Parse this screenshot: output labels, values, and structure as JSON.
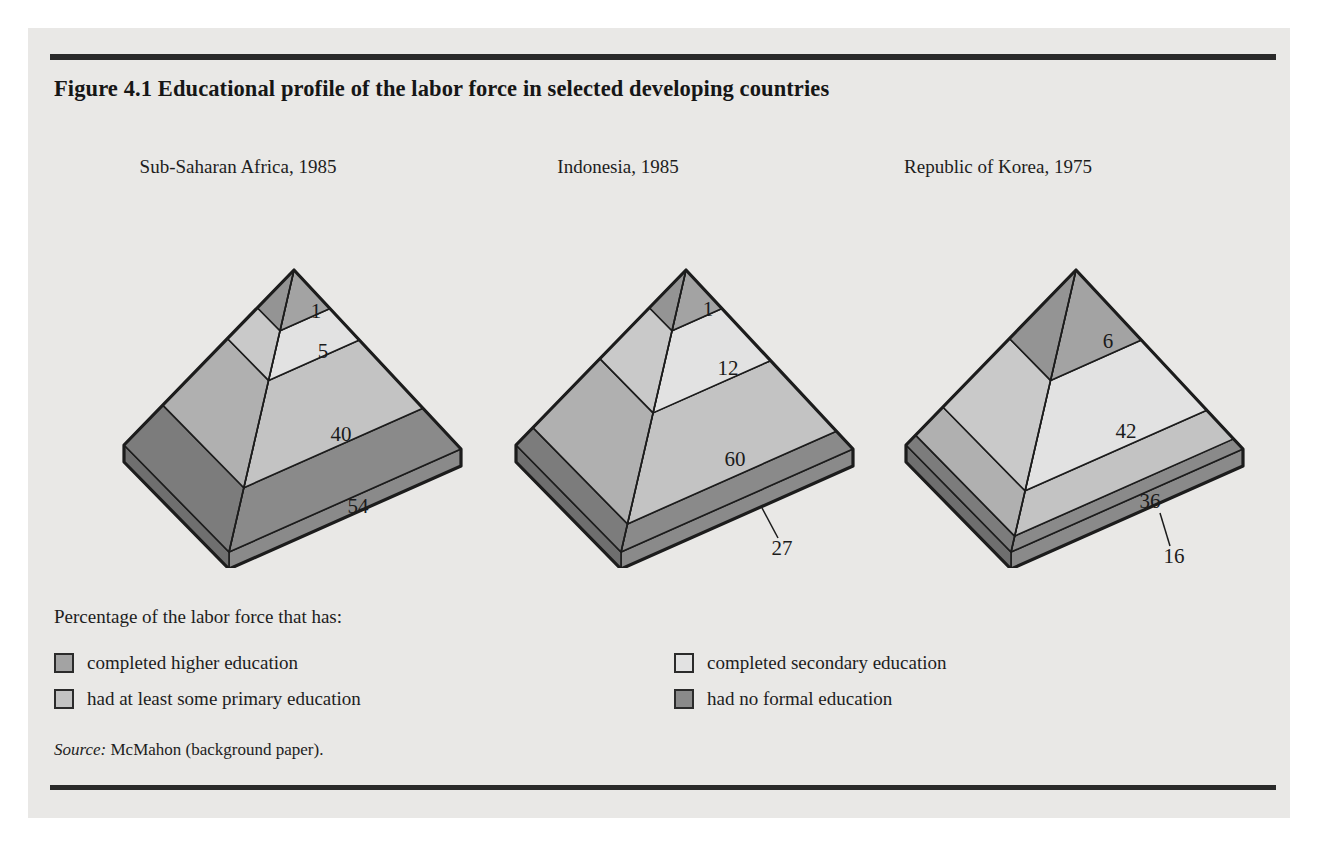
{
  "figure": {
    "title": "Figure 4.1  Educational profile of the labor force in selected developing countries",
    "source_label": "Source:",
    "source_text": "McMahon (background paper)."
  },
  "legend": {
    "intro": "Percentage of the labor force that has:",
    "items": [
      {
        "label": "completed higher education",
        "color": "#a3a3a3",
        "key": "higher"
      },
      {
        "label": "completed secondary education",
        "color": "#e2e2e2",
        "key": "secondary"
      },
      {
        "label": "had at least some primary education",
        "color": "#c3c3c3",
        "key": "primary"
      },
      {
        "label": "had no formal education",
        "color": "#8a8a8a",
        "key": "none"
      }
    ]
  },
  "colors": {
    "higher": "#a3a3a3",
    "secondary": "#e2e2e2",
    "primary": "#c3c3c3",
    "none": "#8a8a8a",
    "higher_shade": "#949494",
    "secondary_shade": "#c9c9c9",
    "primary_shade": "#b0b0b0",
    "none_shade": "#7c7c7c",
    "base_dark": "#8a8a8a",
    "base_dark_shade": "#6f6f6f",
    "outline": "#1c1c1c",
    "panel_bg": "#e9e8e6",
    "rule": "#2a2a2a",
    "text": "#1d1d1d"
  },
  "chart_data": {
    "type": "pie",
    "title": "Figure 4.1  Educational profile of the labor force in selected developing countries",
    "subtitle": "Percentage of the labor force that has:",
    "units": "percent of labor force",
    "legend_position": "bottom",
    "categories": [
      "completed higher education",
      "completed secondary education",
      "had at least some primary education",
      "had no formal education"
    ],
    "panels": [
      {
        "name": "Sub-Saharan Africa, 1985",
        "values": [
          1,
          5,
          40,
          54
        ],
        "labels": [
          "1",
          "5",
          "40",
          "54"
        ],
        "leader_line_on": []
      },
      {
        "name": "Indonesia, 1985",
        "values": [
          1,
          12,
          60,
          27
        ],
        "labels": [
          "1",
          "12",
          "60",
          "27"
        ],
        "leader_line_on": [
          "had no formal education"
        ]
      },
      {
        "name": "Republic of Korea, 1975",
        "values": [
          6,
          42,
          36,
          16
        ],
        "labels": [
          "6",
          "42",
          "36",
          "16"
        ],
        "leader_line_on": [
          "had no formal education"
        ]
      }
    ]
  },
  "pyramids": [
    {
      "title": "Sub-Saharan Africa, 1985",
      "segments": [
        {
          "key": "higher",
          "label": "1"
        },
        {
          "key": "secondary",
          "label": "5"
        },
        {
          "key": "primary",
          "label": "40"
        },
        {
          "key": "none",
          "label": "54"
        }
      ]
    },
    {
      "title": "Indonesia, 1985",
      "segments": [
        {
          "key": "higher",
          "label": "1"
        },
        {
          "key": "secondary",
          "label": "12"
        },
        {
          "key": "primary",
          "label": "60"
        },
        {
          "key": "none",
          "label": "27"
        }
      ]
    },
    {
      "title": "Republic of Korea, 1975",
      "segments": [
        {
          "key": "higher",
          "label": "6"
        },
        {
          "key": "secondary",
          "label": "42"
        },
        {
          "key": "primary",
          "label": "36"
        },
        {
          "key": "none",
          "label": "16"
        }
      ]
    }
  ]
}
